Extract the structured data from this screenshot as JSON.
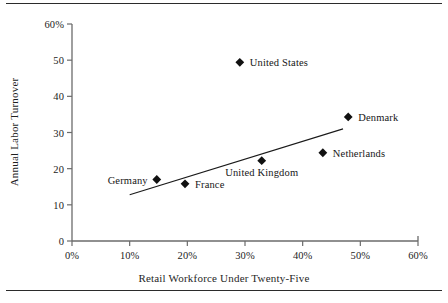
{
  "chart_data": {
    "type": "scatter",
    "title": "",
    "xlabel": "Retail Workforce Under Twenty-Five",
    "ylabel": "Annual Labor Turnover",
    "xlim": [
      0,
      60
    ],
    "ylim": [
      0,
      60
    ],
    "grid": false,
    "legend": "none",
    "xticks": [
      "0%",
      "10%",
      "20%",
      "30%",
      "40%",
      "50%",
      "60%"
    ],
    "xtick_values": [
      0,
      10,
      20,
      30,
      40,
      50,
      60
    ],
    "yticks": [
      "0",
      "10",
      "20",
      "30",
      "40",
      "50",
      "60%"
    ],
    "ytick_values": [
      0,
      10,
      20,
      30,
      40,
      50,
      60
    ],
    "marker": "filled-diamond",
    "marker_color": "#111111",
    "points": [
      {
        "label": "Germany",
        "x": 14.7,
        "y": 17.0,
        "label_pos": "left"
      },
      {
        "label": "France",
        "x": 19.6,
        "y": 15.8,
        "label_pos": "right"
      },
      {
        "label": "United Kingdom",
        "x": 32.9,
        "y": 22.2,
        "label_pos": "below"
      },
      {
        "label": "United States",
        "x": 29.1,
        "y": 49.4,
        "label_pos": "right"
      },
      {
        "label": "Netherlands",
        "x": 43.5,
        "y": 24.4,
        "label_pos": "right"
      },
      {
        "label": "Denmark",
        "x": 47.9,
        "y": 34.3,
        "label_pos": "right"
      }
    ],
    "trendline": {
      "type": "linear-fit",
      "x_start": 10.0,
      "y_start": 12.8,
      "x_end": 47.0,
      "y_end": 31.0,
      "color": "#1a1a1a"
    },
    "axis_color": "#6b6b6b",
    "frame_rules": true
  }
}
